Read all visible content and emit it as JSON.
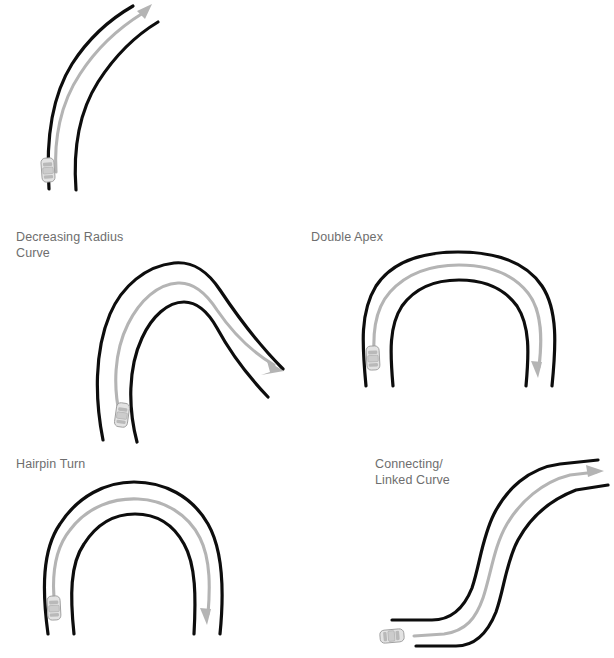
{
  "page": {
    "background_color": "#ffffff",
    "label_color": "#6e6e6e",
    "road_color": "#0d0d0d",
    "racing_line_color": "#b4b4b4",
    "car_color": "#e3e3e3"
  },
  "figures": [
    {
      "id": "constant-radius-curve",
      "label": "",
      "label_lines": [],
      "description": "A single sweeping curve bending up and to the right, with the car entering at the bottom and a gray racing line arrow cutting the apex.",
      "car_heading": "north",
      "arrow_direction": "up-right"
    },
    {
      "id": "decreasing-radius-curve",
      "label": "Decreasing Radius Curve",
      "label_lines": [
        "Decreasing Radius",
        "Curve"
      ],
      "description": "The road sweeps up and left, then turns back sharply down to the right with a tightening radius; the racing line arrow exits to the lower right.",
      "car_heading": "north",
      "arrow_direction": "down-right"
    },
    {
      "id": "double-apex-curve",
      "label": "Double Apex",
      "label_lines": [
        "Double Apex"
      ],
      "description": "A wide, flat-topped U-shaped bend with two apexes; the car enters at the lower left and the racing line arrow exits downward at the right.",
      "car_heading": "north",
      "arrow_direction": "down"
    },
    {
      "id": "hairpin-turn",
      "label": "Hairpin Turn",
      "label_lines": [
        "Hairpin Turn"
      ],
      "description": "A tight 180-degree U-turn; the car enters at the lower left and the racing line arrow exits downward at the right.",
      "car_heading": "north",
      "arrow_direction": "down"
    },
    {
      "id": "connecting-linked-curve",
      "label": "Connecting/ Linked Curve",
      "label_lines": [
        "Connecting/",
        "Linked Curve"
      ],
      "description": "An S-shaped pair of linked curves; the car enters from the lower left travelling right and the racing line arrow exits to the upper right.",
      "car_heading": "east",
      "arrow_direction": "right"
    }
  ]
}
